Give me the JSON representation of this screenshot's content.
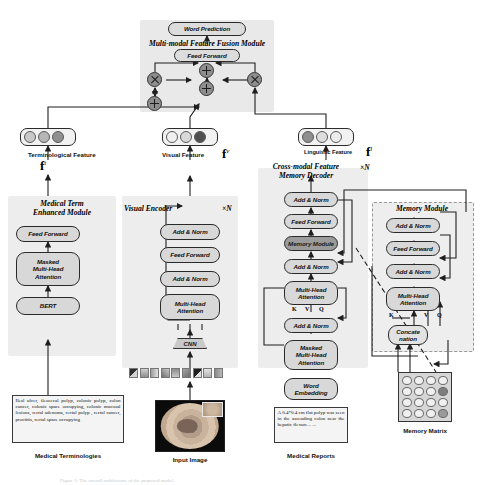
{
  "figure": {
    "caption_fragment": "Figure 1:  The overall architecture of the proposed model."
  },
  "fusion": {
    "word_prediction": "Word Prediction",
    "module_title": "Multi-modal Feature Fusion Module",
    "feed_forward": "Feed Forward",
    "operators": [
      {
        "name": "add-top",
        "glyph": "plus"
      },
      {
        "name": "multiply-left",
        "glyph": "times"
      },
      {
        "name": "multiply-right",
        "glyph": "times"
      },
      {
        "name": "add-middle",
        "glyph": "plus"
      },
      {
        "name": "add-bottom",
        "glyph": "plus"
      }
    ]
  },
  "features": {
    "terminological": {
      "label": "Terminological Feature",
      "symbol": "f",
      "superscript": "t",
      "dots": [
        "#c9c9c9",
        "#b6b6b6",
        "#8f8f8f"
      ]
    },
    "visual": {
      "label": "Visual Feature",
      "symbol": "f",
      "superscript": "v",
      "dots": [
        "#f0f0f0",
        "#d9d9d9",
        "#4f4f4f"
      ]
    },
    "linguistic": {
      "label": "Linguistic Feature",
      "symbol": "f",
      "superscript": "l",
      "dots": [
        "#8f8f8f",
        "#dddddd",
        "#ececec"
      ]
    }
  },
  "medical_term_module": {
    "title_line1": "Medical Term",
    "title_line2": "Enhanced Module",
    "blocks": [
      "Feed Forward",
      "Masked\nMulti-Head\nAttention",
      "BERT"
    ],
    "input_text": "Ileal ulcer, ileocecal polyp, colonic polyp, colon cancer, colonic space occupying, colonic mucosal lesions, rectal adenoma, rectal polyp , rectal cancer, proctitis, rectal space occupying",
    "input_caption": "Medical Terminologies"
  },
  "visual_encoder": {
    "title": "Visual Encoder",
    "repeat": "×N",
    "blocks": [
      "Add & Norm",
      "Feed Forward",
      "Add & Norm",
      "Multi-Head\nAttention"
    ],
    "cnn": "CNN",
    "input_caption": "Input Image",
    "patch_count": 9
  },
  "decoder": {
    "title_line1": "Cross-modal Feature",
    "title_line2": "Memory Decoder",
    "repeat": "×N",
    "blocks": [
      "Add & Norm",
      "Feed Forward",
      "Memory Module",
      "Add & Norm",
      "Multi-Head\nAttention",
      "Add & Norm",
      "Masked\nMulti-Head\nAttention",
      "Word\nEmbedding"
    ],
    "kvq": [
      "K",
      "V",
      "Q"
    ],
    "input_text": "A 0.4*0.4 cm flat polyp was seen in the ascending colon near the hepatic flexure... ...",
    "input_caption": "Medical Reports"
  },
  "memory_module": {
    "title": "Memory Module",
    "blocks": [
      "Add & Norm",
      "Feed Forward",
      "Add & Norm",
      "Multi-Head\nAttention",
      "Concate\nnation"
    ],
    "kvq": [
      "K",
      "V",
      "Q"
    ],
    "matrix_caption": "Memory Matrix",
    "matrix_cells": [
      "#f0f0f0",
      "#f0f0f0",
      "#f0f0f0",
      "#f0f0f0",
      "#f0f0f0",
      "#f0f0f0",
      "#f0f0f0",
      "#7e7e7e",
      "#f0f0f0",
      "#f0f0f0",
      "#f0f0f0",
      "#f0f0f0",
      "#f0f0f0",
      "#f0f0f0",
      "#f0f0f0",
      "#9a9a9a"
    ]
  },
  "patch_colors": [
    "#3b3b3b",
    "#b9b9b9",
    "#9a9a9a",
    "#6f6f6f",
    "#8d8d8d",
    "#a5a5a5",
    "#4a4a4a",
    "#c4c4c4",
    "#8a8a8a"
  ]
}
